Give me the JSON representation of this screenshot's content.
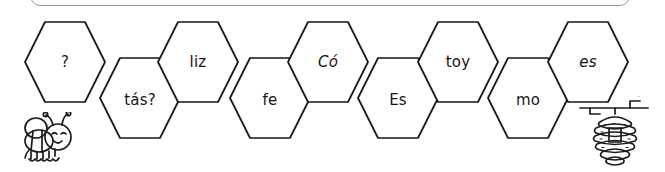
{
  "worksheet": {
    "title": "Honeycomb syllable chain",
    "language": "es",
    "ink_color": "#161616",
    "background_color": "#ffffff",
    "panel_border_color": "#9a9a9a"
  },
  "honeycomb": {
    "cells": [
      {
        "text": "?",
        "row": "upper",
        "italic": false,
        "x": 24,
        "y": 21
      },
      {
        "text": "tás?",
        "row": "lower",
        "italic": false,
        "x": 99,
        "y": 57
      },
      {
        "text": "liz",
        "row": "upper",
        "italic": false,
        "x": 157,
        "y": 21
      },
      {
        "text": "fe",
        "row": "lower",
        "italic": false,
        "x": 229,
        "y": 57
      },
      {
        "text": "Có",
        "row": "upper",
        "italic": true,
        "x": 287,
        "y": 21
      },
      {
        "text": "Es",
        "row": "lower",
        "italic": false,
        "x": 357,
        "y": 57
      },
      {
        "text": "toy",
        "row": "upper",
        "italic": false,
        "x": 417,
        "y": 21
      },
      {
        "text": "mo",
        "row": "lower",
        "italic": false,
        "x": 487,
        "y": 57
      },
      {
        "text": "es",
        "row": "upper",
        "italic": true,
        "x": 547,
        "y": 21
      }
    ]
  },
  "illustrations": {
    "bee": "bee-icon",
    "hive": "beehive-icon"
  }
}
